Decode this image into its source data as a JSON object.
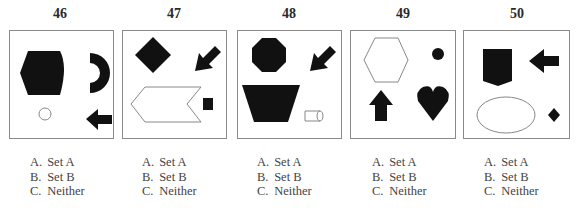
{
  "items": [
    {
      "number": "46",
      "shapes": [
        "black-hexagon",
        "black-half-ring",
        "white-circle",
        "black-left-arrow"
      ],
      "options": [
        {
          "letter": "A.",
          "label": "Set A"
        },
        {
          "letter": "B.",
          "label": "Set B"
        },
        {
          "letter": "C.",
          "label": "Neither"
        }
      ]
    },
    {
      "number": "47",
      "shapes": [
        "black-diamond",
        "black-down-left-arrow",
        "white-chevron",
        "black-square"
      ],
      "options": [
        {
          "letter": "A.",
          "label": "Set A"
        },
        {
          "letter": "B.",
          "label": "Set B"
        },
        {
          "letter": "C.",
          "label": "Neither"
        }
      ]
    },
    {
      "number": "48",
      "shapes": [
        "black-octagon",
        "black-down-left-arrow",
        "black-trapezoid",
        "white-cylinder"
      ],
      "options": [
        {
          "letter": "A.",
          "label": "Set A"
        },
        {
          "letter": "B.",
          "label": "Set B"
        },
        {
          "letter": "C.",
          "label": "Neither"
        }
      ]
    },
    {
      "number": "49",
      "shapes": [
        "white-hexagon",
        "black-dot",
        "black-up-arrow",
        "black-heart"
      ],
      "options": [
        {
          "letter": "A.",
          "label": "Set A"
        },
        {
          "letter": "B.",
          "label": "Set B"
        },
        {
          "letter": "C.",
          "label": "Neither"
        }
      ]
    },
    {
      "number": "50",
      "shapes": [
        "black-pentagon-shield",
        "black-left-arrow",
        "white-ellipse",
        "black-small-diamond"
      ],
      "options": [
        {
          "letter": "A.",
          "label": "Set A"
        },
        {
          "letter": "B.",
          "label": "Set B"
        },
        {
          "letter": "C.",
          "label": "Neither"
        }
      ]
    }
  ],
  "colors": {
    "fill": "#111111",
    "outline": "#8a8a8a",
    "border": "#8a8a8a"
  }
}
